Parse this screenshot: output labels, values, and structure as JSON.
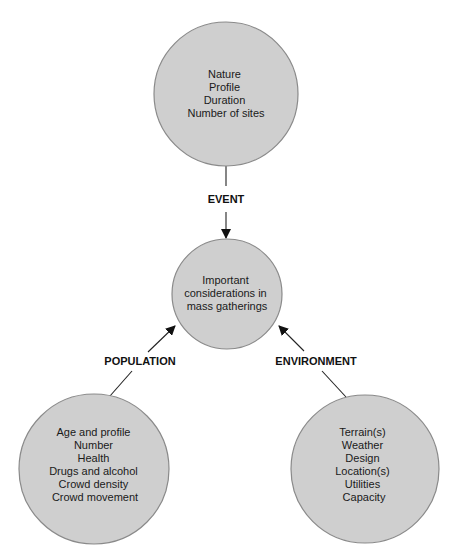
{
  "diagram": {
    "center_node": {
      "lines": [
        "Important",
        "considerations in",
        "mass gatherings"
      ]
    },
    "nodes": [
      {
        "id": "event",
        "edge_label": "EVENT",
        "lines": [
          "Nature",
          "Profile",
          "Duration",
          "Number of sites"
        ]
      },
      {
        "id": "population",
        "edge_label": "POPULATION",
        "lines": [
          "Age and profile",
          "Number",
          "Health",
          "Drugs and alcohol",
          "Crowd density",
          "Crowd movement"
        ]
      },
      {
        "id": "environment",
        "edge_label": "ENVIRONMENT",
        "lines": [
          "Terrain(s)",
          "Weather",
          "Design",
          "Location(s)",
          "Utilities",
          "Capacity"
        ]
      }
    ],
    "colors": {
      "node_fill": "#cfcfcf",
      "node_stroke": "#8a8a8a",
      "edge": "#222222"
    }
  }
}
